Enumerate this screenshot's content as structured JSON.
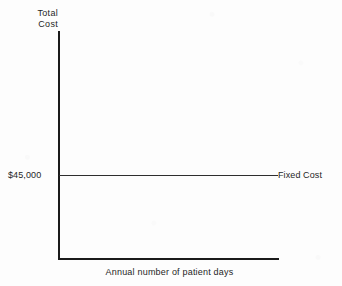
{
  "figure": {
    "background_color": "#fdfdfd",
    "ink_color": "#1b1b1b"
  },
  "chart_data": {
    "type": "line",
    "title": "",
    "subtitle": "",
    "xlabel": "Annual number of patient days",
    "ylabel": "Total Cost",
    "ylabel_lines": [
      "Total",
      "Cost"
    ],
    "grid": false,
    "legend_position": "inline-right",
    "y_tick_labels": [
      "$45,000"
    ],
    "x_tick_labels": [],
    "axis_arrowheads": false,
    "annotations": [
      {
        "text": "Fixed Cost",
        "anchor": "right-of-line",
        "value": 45000
      }
    ],
    "series": [
      {
        "name": "Fixed Cost",
        "label": "Fixed Cost",
        "constant": true,
        "value": 45000,
        "value_label": "$45,000",
        "x": [
          0,
          1
        ],
        "values": [
          45000,
          45000
        ],
        "color": "#2e2e2e"
      }
    ],
    "ylim": [
      0,
      100000
    ],
    "xlim": [
      0,
      1
    ]
  }
}
